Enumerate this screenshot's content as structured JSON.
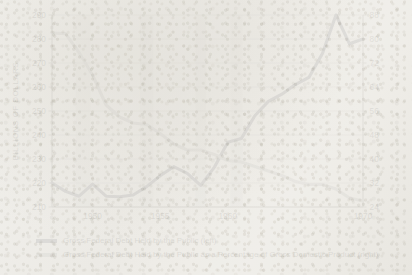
{
  "chart_data": {
    "type": "line",
    "title": "",
    "xlabel": "",
    "ylabel": "BILLIONS OF DOLLARS",
    "y2label": "",
    "xlim": [
      1947,
      1970
    ],
    "ylim": [
      210,
      290
    ],
    "y2lim": [
      24,
      88
    ],
    "grid": true,
    "legend_position": "below",
    "x_ticks": [
      "1950",
      "1955",
      "1960",
      "1970"
    ],
    "x_tick_values": [
      1950,
      1955,
      1960,
      1970
    ],
    "y_ticks": [
      "210",
      "220",
      "230",
      "240",
      "250",
      "260",
      "270",
      "280",
      "290"
    ],
    "y_tick_values": [
      210,
      220,
      230,
      240,
      250,
      260,
      270,
      280,
      290
    ],
    "y2_ticks": [
      "24",
      "32",
      "40",
      "48",
      "56",
      "64",
      "72",
      "80",
      "88"
    ],
    "y2_tick_values": [
      24,
      32,
      40,
      48,
      56,
      64,
      72,
      80,
      88
    ],
    "x": [
      1947,
      1948,
      1949,
      1950,
      1951,
      1952,
      1953,
      1954,
      1955,
      1956,
      1957,
      1958,
      1959,
      1960,
      1961,
      1962,
      1963,
      1964,
      1965,
      1966,
      1967,
      1968,
      1969,
      1970
    ],
    "series": [
      {
        "name": "Gross Federal Debt Held by the Public (left)",
        "axis": "left",
        "color": "#3f4350",
        "values": [
          220.0,
          216.5,
          214.5,
          219.5,
          214.5,
          214.3,
          215.0,
          218.5,
          223.0,
          226.8,
          224.0,
          219.0,
          226.5,
          237.0,
          238.5,
          248.0,
          254.0,
          257.0,
          261.0,
          264.0,
          274.0,
          290.0,
          278.0,
          280.0
        ]
      },
      {
        "name": "Gross Federal Debt Held by the Public as a Percentage of Gross Domestic Product (right)",
        "axis": "right",
        "color": "#9b9b99",
        "values": [
          82.0,
          81.8,
          75.5,
          68.0,
          58.0,
          54.0,
          52.0,
          51.5,
          48.5,
          45.0,
          43.0,
          43.0,
          41.5,
          39.5,
          39.0,
          37.5,
          36.0,
          34.5,
          32.5,
          31.5,
          31.5,
          30.0,
          27.0,
          26.0
        ]
      }
    ],
    "recession_bands": [
      {
        "start": 1948.75,
        "end": 1949.85
      },
      {
        "start": 1953.5,
        "end": 1954.5
      },
      {
        "start": 1957.6,
        "end": 1958.4
      },
      {
        "start": 1960.2,
        "end": 1961.1
      }
    ],
    "recession_band_color": "#d2d2d0"
  },
  "legend": {
    "items": [
      {
        "label": "Gross Federal Debt Held by the Public (left)",
        "swatch": "#3f4350"
      },
      {
        "label": "Gross Federal Debt Held by the Public as a Percentage of Gross Domestic Product (right)",
        "swatch": "#9b9b99"
      }
    ]
  }
}
